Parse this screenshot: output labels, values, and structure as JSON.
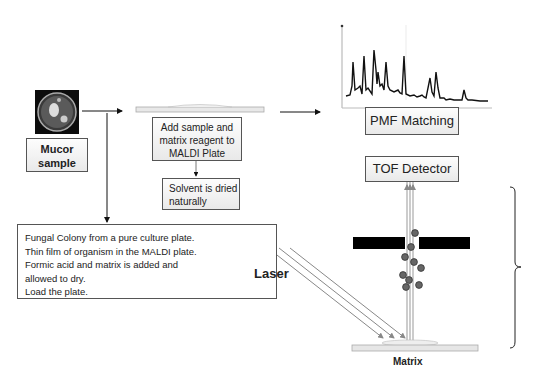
{
  "diagram": {
    "sample": {
      "label_line1": "Mucor",
      "label_line2": "sample",
      "image": "petri-dish-photo"
    },
    "steps": {
      "add_sample": {
        "line1": "Add sample and",
        "line2": "matrix reagent to",
        "line3": "MALDI Plate"
      },
      "solvent": {
        "line1": "Solvent is dried",
        "line2": "naturally"
      },
      "pmf": "PMF Matching",
      "tof": "TOF Detector"
    },
    "notes": [
      "Fungal Colony from a pure culture plate.",
      "Thin film of organism in the MALDI plate.",
      "Formic acid and matrix is added and",
      "allowed to dry.",
      "Load the plate."
    ],
    "instrument": {
      "laser_label": "Laser",
      "matrix_label": "Matrix",
      "ion_color": "#555555",
      "plate_color": "#e6e6e6"
    },
    "spectrum": {
      "type": "line",
      "description": "mass spectrum peaks",
      "peaks_relative_height": [
        0.55,
        0.72,
        0.8,
        0.5,
        0.62,
        0.86,
        0.4,
        0.55,
        0.12
      ]
    }
  }
}
